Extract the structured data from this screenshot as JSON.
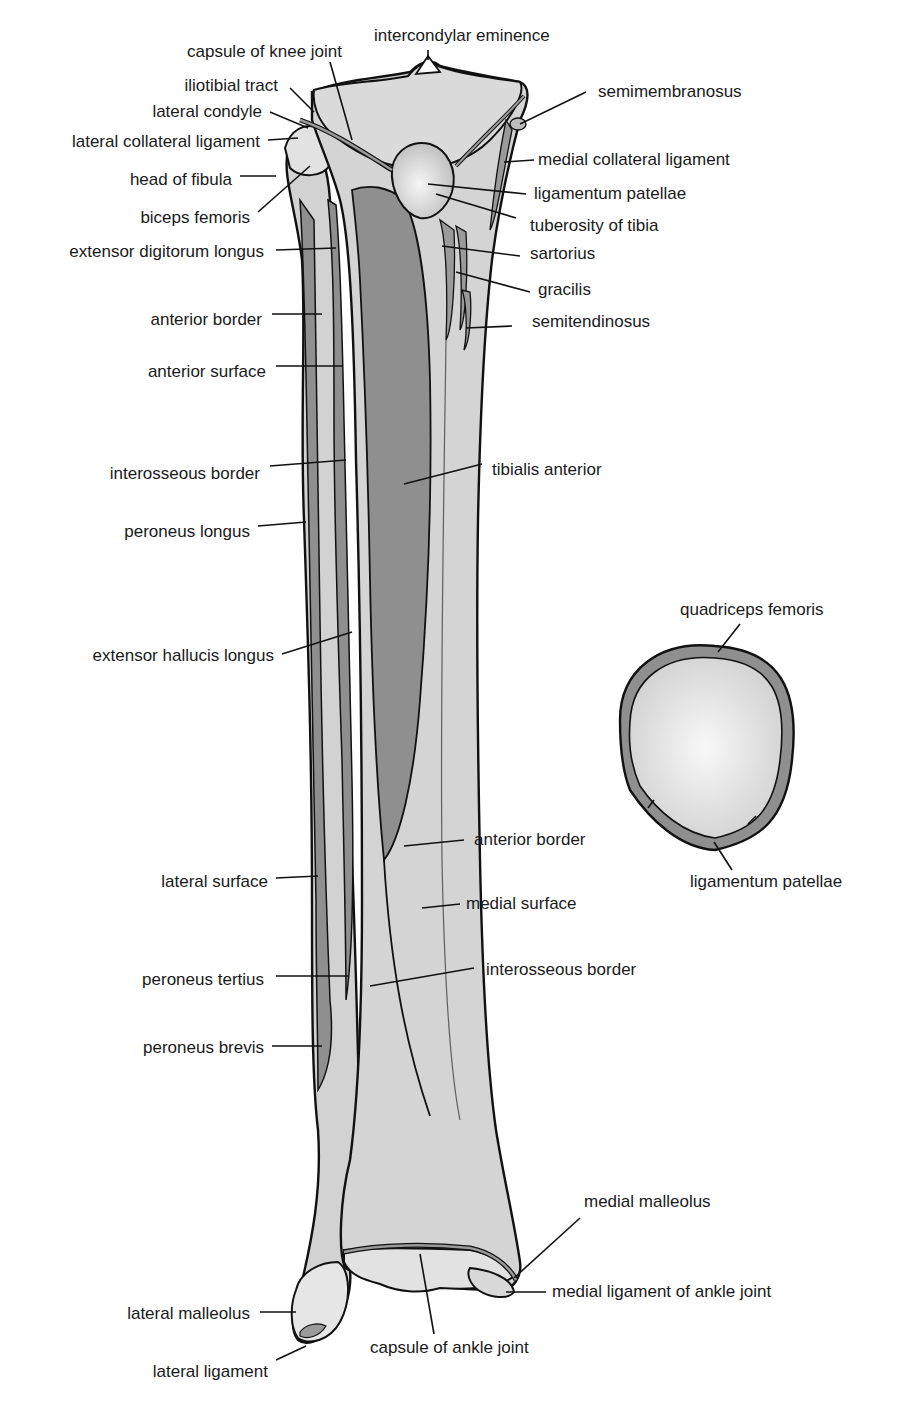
{
  "colors": {
    "bone": "#d4d4d4",
    "bone_light": "#e6e6e6",
    "muscle": "#8f8f8f",
    "outline": "#111111",
    "label": "#1a1a1a"
  },
  "labels": {
    "intercondylar_eminence": "intercondylar eminence",
    "capsule_knee": "capsule of knee joint",
    "iliotibial_tract": "iliotibial tract",
    "lateral_condyle": "lateral condyle",
    "lateral_collateral": "lateral collateral ligament",
    "head_fibula": "head of fibula",
    "biceps_femoris": "biceps femoris",
    "ext_digitorum": "extensor digitorum longus",
    "ant_border_fib": "anterior border",
    "ant_surface": "anterior surface",
    "interosseous_fib": "interosseous border",
    "peroneus_longus": "peroneus longus",
    "ext_hallucis": "extensor hallucis longus",
    "lateral_surface": "lateral surface",
    "peroneus_tertius": "peroneus tertius",
    "peroneus_brevis": "peroneus brevis",
    "lateral_malleolus": "lateral malleolus",
    "lateral_ligament": "lateral ligament",
    "semimembranosus": "semimembranosus",
    "medial_collateral": "medial collateral ligament",
    "lig_patellae": "ligamentum patellae",
    "tuberosity": "tuberosity of tibia",
    "sartorius": "sartorius",
    "gracilis": "gracilis",
    "semitendinosus": "semitendinosus",
    "tibialis_anterior": "tibialis anterior",
    "ant_border_tib": "anterior border",
    "medial_surface": "medial surface",
    "interosseous_tib": "interosseous border",
    "medial_malleolus": "medial malleolus",
    "medial_lig_ankle": "medial ligament of ankle joint",
    "capsule_ankle": "capsule of ankle joint",
    "quadriceps": "quadriceps femoris",
    "patella_lig": "ligamentum patellae"
  }
}
